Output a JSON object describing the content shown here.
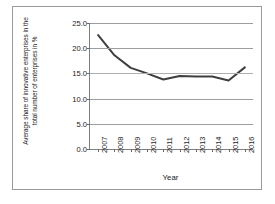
{
  "chart_data": {
    "type": "line",
    "title": "",
    "xlabel": "Year",
    "ylabel": "Average share of innovative enterprises in the total number of enterprises in %",
    "categories": [
      "2007",
      "2008",
      "2009",
      "2010",
      "2011",
      "2012",
      "2013",
      "2014",
      "2015",
      "2016"
    ],
    "values": [
      22.6,
      18.6,
      16.1,
      15.0,
      13.8,
      14.5,
      14.4,
      14.4,
      13.6,
      16.2
    ],
    "series": [
      {
        "name": "Average share of innovative enterprises",
        "values": [
          22.6,
          18.6,
          16.1,
          15.0,
          13.8,
          14.5,
          14.4,
          14.4,
          13.6,
          16.2
        ],
        "color": "#3f3f3f"
      }
    ],
    "ylim": [
      0.0,
      25.0
    ],
    "yticks": [
      "0.0",
      "5.0",
      "10.0",
      "15.0",
      "20.0",
      "25.0"
    ],
    "ytick_values": [
      0.0,
      5.0,
      10.0,
      15.0,
      20.0,
      25.0
    ],
    "grid": true,
    "legend": "none",
    "line_color": "#3f3f3f",
    "gridline_color": "#9d9d9d",
    "axis_color": "#808080",
    "border_color": "#9a9a9a",
    "background": "#ffffff"
  }
}
